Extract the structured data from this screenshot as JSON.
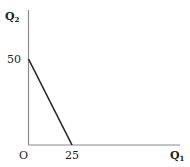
{
  "chart_data": {
    "type": "line",
    "title": "",
    "xlabel": "Q1",
    "ylabel": "Q2",
    "x_axis_label": {
      "base": "Q",
      "sub": "1"
    },
    "y_axis_label": {
      "base": "Q",
      "sub": "2"
    },
    "origin_label": "O",
    "x_ticks": [
      {
        "value": 25,
        "label": "25"
      }
    ],
    "y_ticks": [
      {
        "value": 50,
        "label": "50"
      }
    ],
    "series": [
      {
        "name": "budget line",
        "x": [
          0,
          25
        ],
        "y": [
          50,
          0
        ],
        "color": "#222222"
      }
    ],
    "xlim": [
      0,
      61
    ],
    "ylim": [
      0,
      77
    ],
    "grid": false,
    "legend": null
  },
  "colors": {
    "axis": "#8a8a8a",
    "line": "#222222",
    "text": "#222222"
  }
}
